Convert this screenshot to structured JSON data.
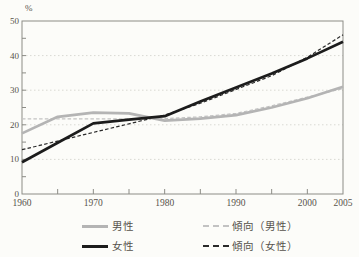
{
  "figure": {
    "unit_label": "%",
    "background": "#fcfcf9",
    "axis_color": "#8c8c86",
    "grid_color": "#d9d9d3",
    "text_color": "#57534b"
  },
  "chart_data": {
    "type": "line",
    "title": "",
    "xlabel": "",
    "ylabel": "%",
    "ylim": [
      0,
      50
    ],
    "y_major_ticks": [
      0,
      10,
      20,
      30,
      40,
      50
    ],
    "y_minor_step": 5,
    "x": [
      1960,
      1965,
      1970,
      1975,
      1980,
      1985,
      1990,
      1995,
      2000,
      2005
    ],
    "x_range": [
      1960,
      2005
    ],
    "x_tick_step": 5,
    "x_tick_labels": [
      "1960",
      "1970",
      "1980",
      "1990",
      "2000",
      "2005"
    ],
    "grid": "horizontal-dotted",
    "legend_position": "bottom",
    "series": [
      {
        "name": "男性",
        "style": "solid",
        "color": "#b4b4b4",
        "values": [
          17.5,
          22.3,
          23.5,
          23.3,
          21.2,
          21.8,
          22.8,
          25.0,
          27.7,
          31.0
        ]
      },
      {
        "name": "女性",
        "style": "solid",
        "color": "#1c1c1c",
        "values": [
          9.2,
          14.8,
          20.4,
          21.5,
          22.5,
          26.7,
          30.8,
          34.8,
          39.2,
          44.0
        ]
      },
      {
        "name": "傾向（男性）",
        "style": "dashed",
        "color": "#c2c2c2",
        "values": [
          21.7,
          21.7,
          21.7,
          21.7,
          21.8,
          22.3,
          23.3,
          25.5,
          28.0,
          30.5
        ]
      },
      {
        "name": "傾向（女性）",
        "style": "dashed",
        "color": "#2a2a2a",
        "values": [
          12.8,
          15.3,
          17.8,
          20.3,
          22.8,
          26.2,
          30.2,
          34.2,
          39.5,
          46.0
        ]
      }
    ]
  }
}
